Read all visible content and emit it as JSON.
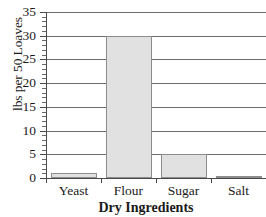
{
  "chart_data": {
    "type": "bar",
    "title": "",
    "categories": [
      "Yeast",
      "Flour",
      "Sugar",
      "Salt"
    ],
    "values": [
      1,
      30,
      5,
      0.5
    ],
    "xlabel": "Dry Ingredients",
    "ylabel": "lbs per 50 Loaves",
    "ylim": [
      0,
      35
    ],
    "ytick_step": 5,
    "yminor_step": 1,
    "yticks": [
      0,
      5,
      10,
      15,
      20,
      25,
      30,
      35
    ],
    "ytick_labels": [
      "0",
      "5",
      "10",
      "15",
      "20",
      "25",
      "30",
      "35"
    ],
    "grid": "horizontal",
    "legend": "none",
    "colors": {
      "bar_fill": "#e1e1e1",
      "bar_edge": "#8c8c8c",
      "gridline": "#6e6e6e",
      "axis": "#4a4a4a",
      "text": "#1a1a1a",
      "background": "#ffffff"
    }
  }
}
